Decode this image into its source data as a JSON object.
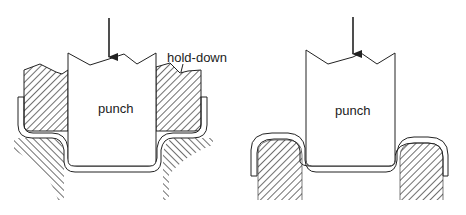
{
  "figure": {
    "left": {
      "punch_label": "punch",
      "hold_down_label": "hold-down",
      "parts": [
        "punch",
        "hold-down",
        "sheet",
        "die"
      ]
    },
    "right": {
      "punch_label": "punch",
      "parts": [
        "punch",
        "sheet",
        "die"
      ]
    }
  },
  "colors": {
    "stroke": "#222222",
    "background": "#ffffff"
  }
}
